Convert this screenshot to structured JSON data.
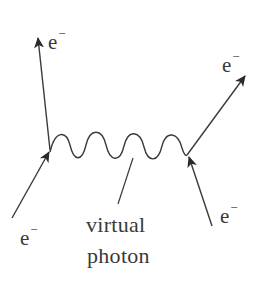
{
  "diagram": {
    "type": "feynman-diagram",
    "colors": {
      "ink": "#3a3a3a",
      "background": "#ffffff"
    },
    "particles": [
      {
        "id": "out-left",
        "symbol": "e",
        "charge": "−",
        "direction": "outgoing"
      },
      {
        "id": "out-right",
        "symbol": "e",
        "charge": "−",
        "direction": "outgoing"
      },
      {
        "id": "in-left",
        "symbol": "e",
        "charge": "−",
        "direction": "incoming"
      },
      {
        "id": "in-right",
        "symbol": "e",
        "charge": "−",
        "direction": "incoming"
      }
    ],
    "propagator": {
      "label_line1": "virtual",
      "label_line2": "photon",
      "style": "wavy"
    }
  }
}
